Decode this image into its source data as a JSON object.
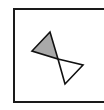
{
  "diagram": {
    "type": "bowtie",
    "frame": {
      "stroke": "#1a1a1a"
    },
    "shapes": [
      {
        "name": "upper-left-triangle",
        "points": "50,32 32,51 58,59",
        "fill": "#a9a9a9",
        "stroke": "#111111"
      },
      {
        "name": "lower-right-triangle",
        "points": "58,59 83,65 65,84",
        "fill": "#ffffff",
        "stroke": "#111111"
      }
    ]
  }
}
